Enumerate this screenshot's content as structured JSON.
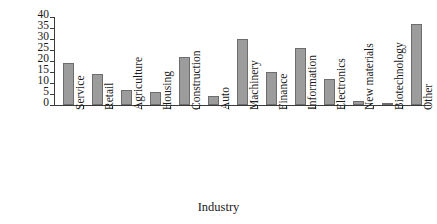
{
  "chart_data": {
    "type": "bar",
    "title": "",
    "xlabel": "Industry",
    "ylabel": "Number of firms",
    "categories": [
      "Service",
      "Retail",
      "Agriculture",
      "Housing",
      "Construction",
      "Auto",
      "Machinery",
      "Finance",
      "Information",
      "Electronics",
      "New materials",
      "Biotechnology",
      "Other"
    ],
    "values": [
      19,
      14,
      7,
      6,
      22,
      4,
      30,
      15,
      26,
      12,
      2,
      1,
      37
    ],
    "ylim": [
      0,
      40
    ],
    "yticks": [
      0,
      5,
      10,
      15,
      20,
      25,
      30,
      35,
      40
    ],
    "ytick_labels": [
      "0",
      "5",
      "10",
      "15",
      "20",
      "25",
      "30",
      "35",
      "40"
    ],
    "grid": false,
    "legend": false,
    "bar_color": "#9c9c9c",
    "bar_edge_color": "#6d6d6d",
    "axis_color": "#3a3a3a"
  }
}
